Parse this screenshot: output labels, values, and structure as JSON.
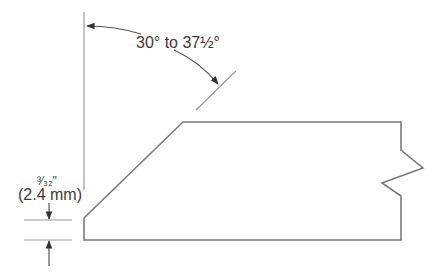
{
  "diagram": {
    "angle_label": "30° to 37½°",
    "root_face_fraction": "³⁄₃₂\"",
    "root_face_metric": "(2.4 mm)",
    "colors": {
      "outline": "#7a7a7a",
      "dimension": "#9a9a9a",
      "arrow": "#333333",
      "text": "#3a3a3a"
    }
  }
}
